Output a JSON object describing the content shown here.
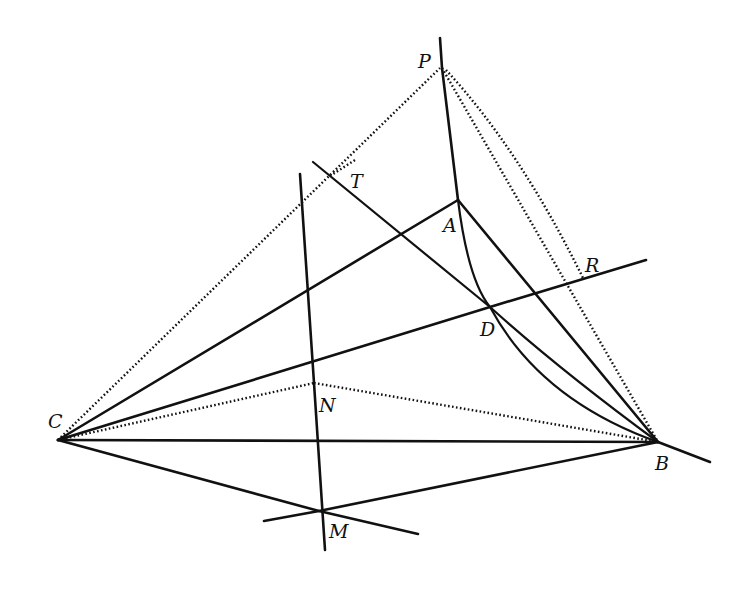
{
  "figure": {
    "type": "geometric-construction",
    "points": {
      "P": {
        "label": "P",
        "x": 440,
        "y": 68,
        "lx": 418,
        "ly": 68
      },
      "T": {
        "label": "T",
        "x": 330,
        "y": 176,
        "lx": 350,
        "ly": 188
      },
      "A": {
        "label": "A",
        "x": 458,
        "y": 200,
        "lx": 443,
        "ly": 232
      },
      "R": {
        "label": "R",
        "x": 575,
        "y": 282,
        "lx": 585,
        "ly": 272
      },
      "D": {
        "label": "D",
        "x": 490,
        "y": 307,
        "lx": 480,
        "ly": 336
      },
      "N": {
        "label": "N",
        "x": 314,
        "y": 383,
        "lx": 319,
        "ly": 412
      },
      "C": {
        "label": "C",
        "x": 58,
        "y": 440,
        "lx": 48,
        "ly": 428
      },
      "B": {
        "label": "B",
        "x": 658,
        "y": 442,
        "lx": 655,
        "ly": 470
      },
      "M": {
        "label": "M",
        "x": 319,
        "y": 511,
        "lx": 329,
        "ly": 538
      }
    },
    "labels": [
      "P",
      "T",
      "A",
      "R",
      "D",
      "N",
      "C",
      "B",
      "M"
    ]
  }
}
